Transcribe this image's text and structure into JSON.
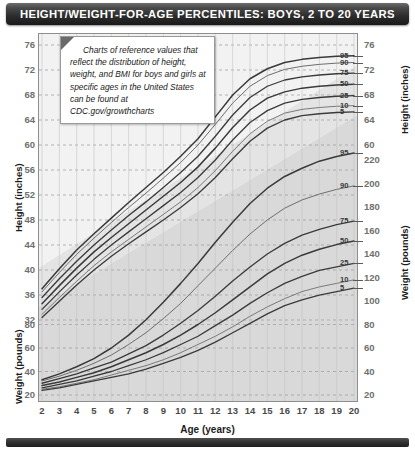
{
  "header": {
    "title": "HEIGHT/WEIGHT-FOR-AGE PERCENTILES: BOYS, 2 TO 20 YEARS"
  },
  "note": {
    "text": "Charts of reference values that reflect the distribution of height, weight, and BMI for boys and girls at specific ages in the United States can be found at CDC.gov/growthcharts"
  },
  "axes": {
    "x_title": "Age (years)",
    "left_height_title": "Height (inches)",
    "left_weight_title": "Weight (pounds)",
    "right_height_title": "Height (inches)",
    "right_weight_title": "Weight (pounds)"
  },
  "chart_data": {
    "type": "line",
    "title": "HEIGHT/WEIGHT-FOR-AGE PERCENTILES: BOYS, 2 TO 20 YEARS",
    "xlabel": "Age (years)",
    "ylabel": "Height (inches) / Weight (pounds)",
    "grid": true,
    "legend": "inline-right-labels",
    "x": [
      2,
      3,
      4,
      5,
      6,
      7,
      8,
      9,
      10,
      11,
      12,
      13,
      14,
      15,
      16,
      17,
      18,
      19,
      20
    ],
    "xlim": [
      2,
      20
    ],
    "x_ticks": [
      "2",
      "3",
      "4",
      "5",
      "6",
      "7",
      "8",
      "9",
      "10",
      "11",
      "12",
      "13",
      "14",
      "15",
      "16",
      "17",
      "18",
      "19",
      "20"
    ],
    "height_axis": {
      "unit": "inches",
      "left_ticks": [
        "76",
        "72",
        "68",
        "64",
        "60",
        "56",
        "52",
        "48",
        "44",
        "40",
        "36",
        "32"
      ],
      "right_ticks": [
        "76",
        "72",
        "68",
        "64",
        "60"
      ],
      "ylim": [
        30,
        78
      ]
    },
    "weight_axis": {
      "unit": "pounds",
      "left_ticks": [
        "80",
        "60",
        "40",
        "20"
      ],
      "right_ticks": [
        "220",
        "200",
        "180",
        "160",
        "140",
        "120",
        "100",
        "80",
        "60",
        "40",
        "20"
      ],
      "ylim": [
        15,
        235
      ]
    },
    "percentile_labels": [
      "95",
      "90",
      "75",
      "50",
      "25",
      "10",
      "5"
    ],
    "series": [
      {
        "name": "Height 95th",
        "group": "height",
        "unit": "inches",
        "values": [
          37.0,
          40.2,
          43.2,
          45.8,
          48.3,
          50.8,
          53.2,
          55.6,
          58.2,
          61.0,
          64.5,
          68.0,
          70.6,
          72.2,
          73.2,
          73.7,
          74.0,
          74.2,
          74.3
        ]
      },
      {
        "name": "Height 90th",
        "group": "height",
        "unit": "inches",
        "values": [
          36.5,
          39.6,
          42.5,
          45.1,
          47.6,
          50.0,
          52.3,
          54.7,
          57.2,
          60.0,
          63.3,
          66.7,
          69.4,
          71.1,
          72.1,
          72.6,
          72.9,
          73.1,
          73.2
        ]
      },
      {
        "name": "Height 75th",
        "group": "height",
        "unit": "inches",
        "values": [
          35.6,
          38.6,
          41.4,
          44.0,
          46.4,
          48.7,
          50.9,
          53.2,
          55.6,
          58.2,
          61.4,
          64.8,
          67.6,
          69.4,
          70.4,
          70.9,
          71.2,
          71.4,
          71.5
        ]
      },
      {
        "name": "Height 50th",
        "group": "height",
        "unit": "inches",
        "values": [
          34.6,
          37.5,
          40.3,
          42.9,
          45.2,
          47.4,
          49.6,
          51.8,
          54.0,
          56.5,
          59.5,
          62.8,
          65.6,
          67.5,
          68.5,
          69.1,
          69.4,
          69.6,
          69.7
        ]
      },
      {
        "name": "Height 25th",
        "group": "height",
        "unit": "inches",
        "values": [
          33.7,
          36.5,
          39.2,
          41.7,
          44.0,
          46.1,
          48.2,
          50.3,
          52.4,
          54.8,
          57.6,
          60.8,
          63.6,
          65.5,
          66.7,
          67.3,
          67.6,
          67.8,
          67.9
        ]
      },
      {
        "name": "Height 10th",
        "group": "height",
        "unit": "inches",
        "values": [
          32.9,
          35.6,
          38.2,
          40.7,
          42.9,
          44.9,
          46.9,
          48.9,
          50.9,
          53.2,
          55.9,
          59.0,
          61.8,
          63.8,
          65.1,
          65.7,
          66.0,
          66.2,
          66.3
        ]
      },
      {
        "name": "Height 5th",
        "group": "height",
        "unit": "inches",
        "values": [
          32.4,
          35.0,
          37.6,
          40.0,
          42.2,
          44.2,
          46.1,
          48.0,
          50.0,
          52.2,
          54.8,
          57.8,
          60.6,
          62.7,
          64.0,
          64.7,
          65.0,
          65.2,
          65.3
        ]
      },
      {
        "name": "Weight 95th",
        "group": "weight",
        "unit": "pounds",
        "values": [
          33,
          38,
          44,
          51,
          60,
          71,
          84,
          99,
          115,
          132,
          150,
          167,
          183,
          196,
          206,
          213,
          219,
          223,
          226
        ]
      },
      {
        "name": "Weight 90th",
        "group": "weight",
        "unit": "pounds",
        "values": [
          32,
          36,
          41,
          47,
          54,
          63,
          73,
          85,
          98,
          113,
          128,
          143,
          157,
          169,
          179,
          186,
          191,
          195,
          198
        ]
      },
      {
        "name": "Weight 75th",
        "group": "weight",
        "unit": "pounds",
        "values": [
          30,
          34,
          38,
          43,
          48,
          55,
          62,
          71,
          81,
          92,
          104,
          117,
          129,
          140,
          149,
          156,
          161,
          165,
          168
        ]
      },
      {
        "name": "Weight 50th",
        "group": "weight",
        "unit": "pounds",
        "values": [
          28,
          31,
          35,
          39,
          44,
          50,
          56,
          63,
          71,
          80,
          90,
          101,
          112,
          123,
          132,
          139,
          144,
          148,
          151
        ]
      },
      {
        "name": "Weight 25th",
        "group": "weight",
        "unit": "pounds",
        "values": [
          26,
          29,
          32,
          36,
          40,
          45,
          50,
          56,
          63,
          70,
          79,
          88,
          98,
          107,
          115,
          121,
          126,
          129,
          132
        ]
      },
      {
        "name": "Weight 10th",
        "group": "weight",
        "unit": "pounds",
        "values": [
          25,
          27,
          30,
          33,
          37,
          41,
          45,
          50,
          56,
          63,
          70,
          78,
          87,
          95,
          102,
          108,
          112,
          115,
          118
        ]
      },
      {
        "name": "Weight 5th",
        "group": "weight",
        "unit": "pounds",
        "values": [
          24,
          26,
          29,
          32,
          35,
          38,
          42,
          47,
          52,
          58,
          65,
          73,
          81,
          89,
          96,
          101,
          105,
          108,
          111
        ]
      }
    ]
  }
}
